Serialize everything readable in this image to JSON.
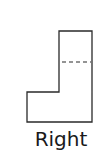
{
  "figure": {
    "view_label": "Right",
    "shape": {
      "outline_color": "#2a2a2a",
      "hidden_line_color": "#2a2a2a",
      "outline_points": "59,31 92,31 92,122 27,122 27,92 59,92",
      "hidden_line": {
        "x1": 62,
        "y1": 62,
        "x2": 91,
        "y2": 62
      }
    }
  }
}
